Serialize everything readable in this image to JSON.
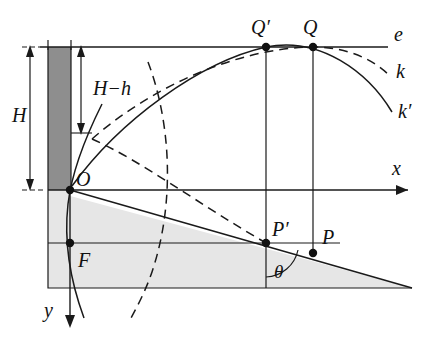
{
  "figure": {
    "background_color": "#ffffff",
    "stroke_color": "#1a1a1a",
    "wall_fill": "#8c8c8c",
    "ground_fill": "#e4e4e4",
    "width": 428,
    "height": 341
  },
  "labels": {
    "H": "H",
    "H_minus_h": "H−h",
    "O": "O",
    "F": "F",
    "P": "P",
    "P_prime": "P′",
    "Q": "Q",
    "Q_prime": "Q′",
    "theta": "θ",
    "x_axis": "x",
    "y_axis": "y",
    "line_e": "e",
    "curve_k": "k",
    "curve_k_prime": "k′"
  },
  "points": {
    "O": {
      "x": 70,
      "y": 190,
      "label": "O"
    },
    "F": {
      "x": 70,
      "y": 243,
      "label": "F"
    },
    "P_prime": {
      "x": 266,
      "y": 243,
      "label": "P′"
    },
    "P": {
      "x": 313,
      "y": 253,
      "label": "P"
    },
    "Q_prime": {
      "x": 266,
      "y": 47,
      "label": "Q′"
    },
    "Q": {
      "x": 313,
      "y": 47,
      "label": "Q"
    }
  },
  "geometry": {
    "line_e_y": 47,
    "x_axis_y": 190,
    "wall": {
      "x": 48,
      "y": 47,
      "width": 23,
      "height": 143
    },
    "ground_polygon": "48,190 412,288 48,288",
    "ground_left_rect": {
      "x": 48,
      "y": 190,
      "width": 22,
      "height": 98
    },
    "incline_end": {
      "x": 412,
      "y": 288
    },
    "theta_arc_center": {
      "x": 266,
      "y": 243
    },
    "H_arrow": {
      "x": 30,
      "y_top": 47,
      "y_bottom": 189
    },
    "Hh_arrow": {
      "x": 81,
      "y_top": 47,
      "y_bottom": 133
    }
  },
  "curves": {
    "k_prime_solid": "Solid parabola from O rising to apex at Q' then falling to the right edge",
    "k_dashed": "Dashed parabola from near O rising to apex at Q then falling to the right edge",
    "arc_solid": "Solid circular arc through O curving downward past F",
    "arc_dashed": "Dashed circular arc passing through the field below line e"
  }
}
